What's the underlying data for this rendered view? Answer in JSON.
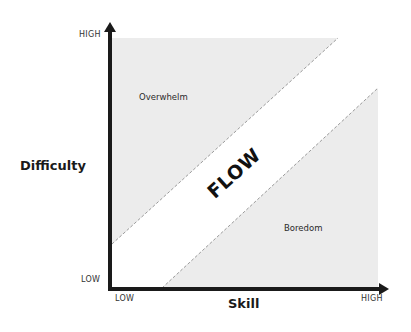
{
  "diagram": {
    "y_axis": {
      "label": "Difficulty",
      "tick_high": "HIGH",
      "tick_low": "LOW"
    },
    "x_axis": {
      "label": "Skill",
      "tick_low": "LOW",
      "tick_high": "HIGH"
    },
    "regions": {
      "upper": "Overwhelm",
      "middle": "FLOW",
      "lower": "Boredom"
    },
    "colors": {
      "region_fill": "#ececec",
      "axis": "#1a1a1a",
      "divider": "#9a9a9a"
    }
  }
}
